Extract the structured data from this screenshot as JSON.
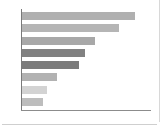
{
  "chart_data": {
    "type": "bar",
    "orientation": "horizontal",
    "title": "",
    "subtitle": "",
    "xlabel": "",
    "ylabel": "",
    "grid": false,
    "legend": null,
    "axis": {
      "y_axis_visible": true,
      "x_axis_visible": true,
      "x_axis_color": "#8c8c8c",
      "y_axis_color": "#7a7a7a",
      "xlim": [
        0,
        130
      ],
      "tick_labels_x": [],
      "tick_labels_y": []
    },
    "categories": [
      "",
      "",
      "",
      "",
      "",
      "",
      "",
      ""
    ],
    "values": [
      114,
      98,
      74,
      63,
      57,
      35,
      25,
      21
    ],
    "bar_colors": [
      "#b0b0b0",
      "#b5b5b5",
      "#a8a8a8",
      "#818181",
      "#7b7b7b",
      "#b2b2b2",
      "#d3d3d3",
      "#bdbdbd"
    ]
  },
  "panel": {
    "border_color": "#d8d8d8",
    "background": "#ffffff"
  },
  "divider": {
    "color": "#cfcfcf"
  }
}
